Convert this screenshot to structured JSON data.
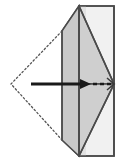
{
  "figure": {
    "type": "origami-fold-diagram",
    "width": 122,
    "height": 168,
    "background_color": "#ffffff"
  },
  "colors": {
    "paper_front": "#f0f0f0",
    "paper_shadow": "#d5d5d5",
    "paper_mid": "#cfcfcf",
    "outline": "#4a4a4a",
    "outline_dark": "#333333",
    "arrow": "#1a1a1a",
    "dotted": "#555555"
  },
  "shapes": {
    "right_panel": {
      "name": "right-rectangle-panel",
      "points": "79,6 114,6 114,156 79,156",
      "fill": "#f0f0f0",
      "stroke": "#4a4a4a"
    },
    "upper_flap": {
      "name": "upper-folded-flap",
      "points": "62,31 79,6 79,84 62,84",
      "fill": "#d3d3d3",
      "stroke": "#4a4a4a"
    },
    "lower_flap": {
      "name": "lower-folded-flap",
      "points": "62,84 79,84 79,156 62,140",
      "fill": "#d3d3d3",
      "stroke": "#4a4a4a"
    },
    "upper_wedge": {
      "name": "upper-right-wedge",
      "points": "79,6 114,6 114,84 79,84",
      "fill": "#dcdcdc",
      "stroke": "none"
    },
    "chevron_upper": {
      "name": "chevron-upper-gray",
      "points": "62,31 79,6 114,84 79,84",
      "fill": "#cccccc",
      "stroke": "#4a4a4a"
    },
    "chevron_lower": {
      "name": "chevron-lower-gray",
      "points": "62,140 79,156 114,84 79,84",
      "fill": "#cccccc",
      "stroke": "#4a4a4a"
    },
    "dotted_triangle": {
      "name": "dotted-phantom-triangle",
      "points": "62,31 11,84 62,140",
      "stroke": "#555555",
      "dash": "1.6 2.4"
    },
    "vertical_fold": {
      "name": "vertical-fold-crease",
      "x1": 79,
      "y1": 6,
      "x2": 79,
      "y2": 156
    },
    "left_vertical_edge": {
      "name": "left-vertical-edge",
      "x1": 62,
      "y1": 31,
      "x2": 62,
      "y2": 140
    },
    "apex_point": {
      "name": "right-apex-vertex",
      "x": 114,
      "y": 84
    }
  },
  "arrow": {
    "name": "fold-direction-arrow",
    "solid_start_x": 31,
    "solid_end_x": 84,
    "y": 84,
    "head_tip_x": 91,
    "dashed_start_x": 93,
    "dashed_end_x": 112,
    "color": "#1a1a1a",
    "stroke_width": 3.2,
    "dash_pattern": "4 3",
    "label": ""
  },
  "labels": {
    "step_number": "",
    "note": ""
  }
}
